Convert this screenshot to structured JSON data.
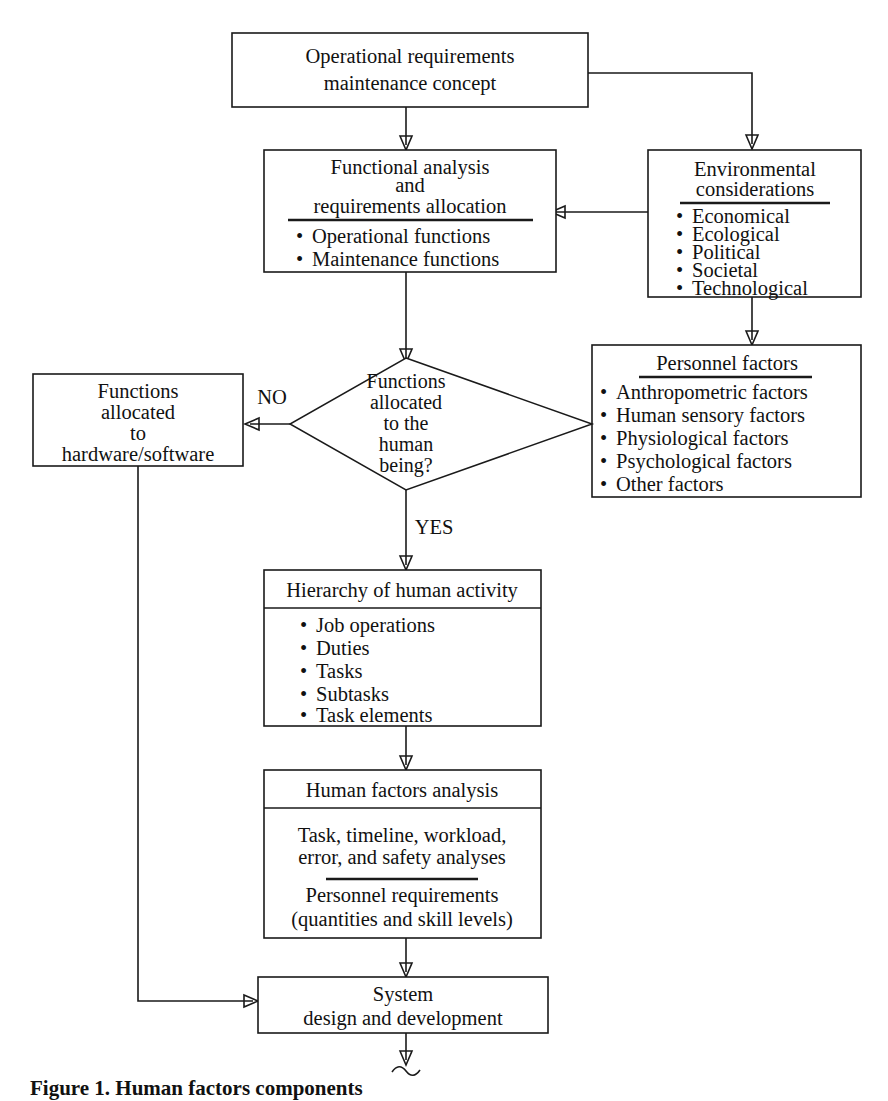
{
  "figure": {
    "caption_label": "Figure 1.",
    "caption_text": "Human factors components"
  },
  "nodes": {
    "operational_requirements": {
      "lines": [
        "Operational requirements",
        "maintenance concept"
      ]
    },
    "functional_analysis": {
      "header_lines": [
        "Functional analysis",
        "and",
        "requirements allocation"
      ],
      "items": [
        "Operational functions",
        "Maintenance functions"
      ]
    },
    "environmental_considerations": {
      "header_lines": [
        "Environmental",
        "considerations"
      ],
      "items": [
        "Economical",
        "Ecological",
        "Political",
        "Societal",
        "Technological"
      ]
    },
    "personnel_factors": {
      "header_lines": [
        "Personnel factors"
      ],
      "items": [
        "Anthropometric factors",
        "Human sensory factors",
        "Physiological factors",
        "Psychological factors",
        "Other factors"
      ]
    },
    "decision": {
      "lines": [
        "Functions",
        "allocated",
        "to the",
        "human",
        "being?"
      ]
    },
    "hardware_software": {
      "lines": [
        "Functions",
        "allocated",
        "to",
        "hardware/software"
      ]
    },
    "hierarchy_human_activity": {
      "header_lines": [
        "Hierarchy of human activity"
      ],
      "items": [
        "Job operations",
        "Duties",
        "Tasks",
        "Subtasks",
        "Task elements"
      ]
    },
    "human_factors_analysis": {
      "header_lines": [
        "Human factors analysis"
      ],
      "body_top": [
        "Task, timeline, workload,",
        "error, and safety analyses"
      ],
      "body_bottom": [
        "Personnel requirements",
        "(quantities and skill levels)"
      ]
    },
    "system_design": {
      "lines": [
        "System",
        "design and development"
      ]
    }
  },
  "edges": {
    "no_label": "NO",
    "yes_label": "YES"
  },
  "style": {
    "line_color": "#1a1a1a",
    "box_fill": "#ffffff",
    "text_color": "#111111",
    "bullet_glyph": "•"
  }
}
